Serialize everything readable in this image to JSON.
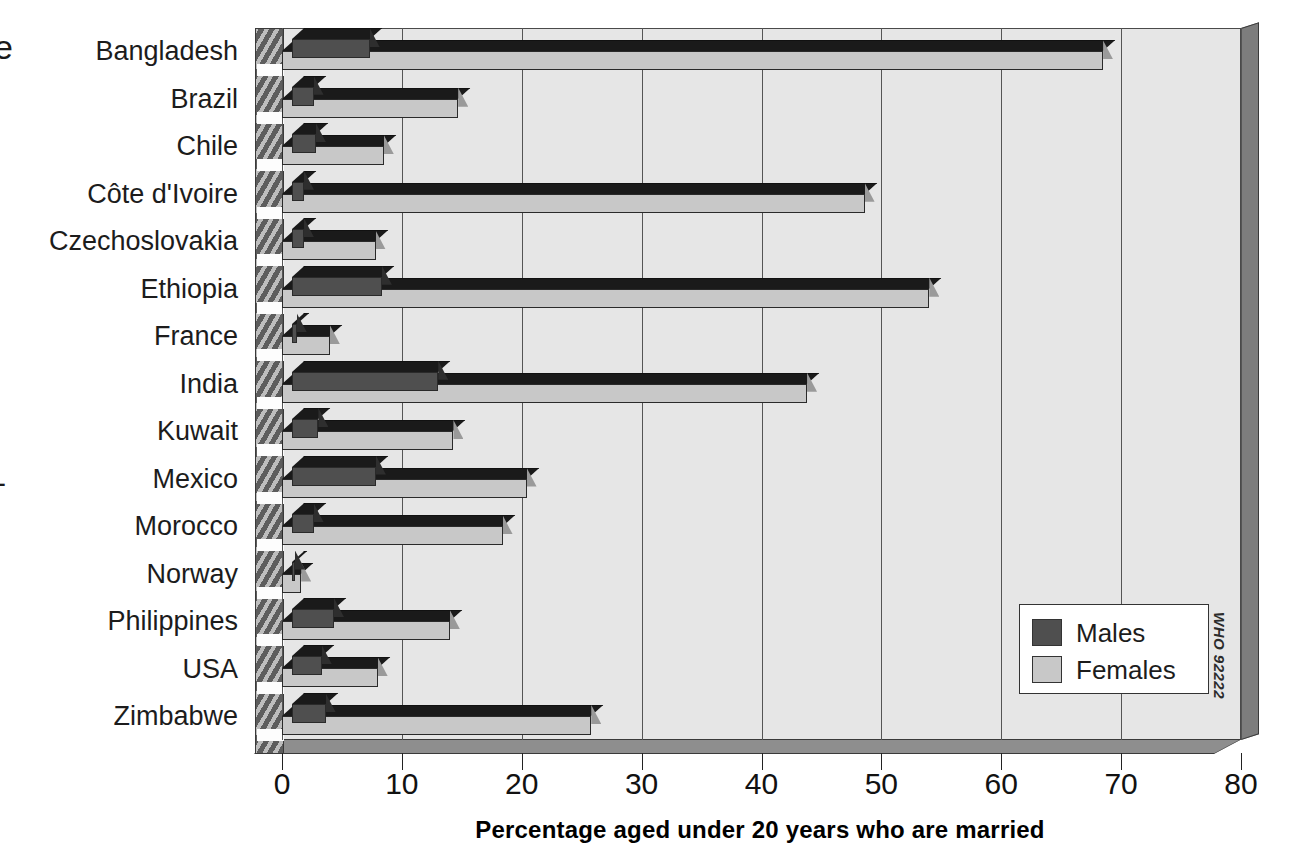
{
  "chart_data": {
    "type": "bar",
    "orientation": "horizontal",
    "title": "",
    "xlabel": "Percentage  aged under 20 years who are married",
    "ylabel": "",
    "xlim": [
      0,
      80
    ],
    "xticks": [
      0,
      10,
      20,
      30,
      40,
      50,
      60,
      70,
      80
    ],
    "grid": true,
    "legend_position": "inside-bottom-right",
    "categories": [
      "Bangladesh",
      "Brazil",
      "Chile",
      "Côte d'Ivoire",
      "Czechoslovakia",
      "Ethiopia",
      "France",
      "India",
      "Kuwait",
      "Mexico",
      "Morocco",
      "Norway",
      "Philippines",
      "USA",
      "Zimbabwe"
    ],
    "series": [
      {
        "name": "Males",
        "color": "#4f4f4f",
        "values": [
          6.5,
          1.8,
          2.0,
          1.0,
          1.0,
          7.5,
          0.4,
          12.2,
          2.2,
          7.0,
          1.8,
          0.2,
          3.5,
          2.5,
          2.8
        ]
      },
      {
        "name": "Females",
        "color": "#c8c8c8",
        "values": [
          68.5,
          14.7,
          8.5,
          48.6,
          7.8,
          54.0,
          4.0,
          43.8,
          14.3,
          20.4,
          18.4,
          1.6,
          14.0,
          8.0,
          25.8
        ]
      }
    ]
  },
  "axis": {
    "tick_labels": [
      "0",
      "10",
      "20",
      "30",
      "40",
      "50",
      "60",
      "70",
      "80"
    ],
    "title": "Percentage  aged under 20 years who are married"
  },
  "legend": {
    "items": [
      {
        "label": "Males",
        "color": "#4f4f4f"
      },
      {
        "label": "Females",
        "color": "#c8c8c8"
      }
    ]
  },
  "credit": {
    "text": "WHO 92222"
  },
  "stray_marks": {
    "top_left": "e",
    "mid_left": "-"
  }
}
